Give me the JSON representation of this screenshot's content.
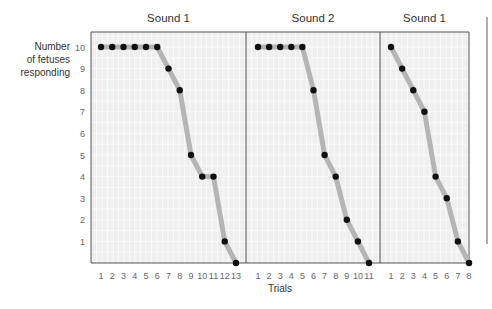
{
  "chart_data": {
    "type": "line",
    "ylabel": "Number of fetuses responding",
    "xlabel": "Trials",
    "ylim": [
      0,
      10
    ],
    "yticks": [
      1,
      2,
      3,
      4,
      5,
      6,
      7,
      8,
      9,
      10
    ],
    "grid": true,
    "legend": null,
    "panels": [
      {
        "title": "Sound 1",
        "x": [
          1,
          2,
          3,
          4,
          5,
          6,
          7,
          8,
          9,
          10,
          11,
          12,
          13
        ],
        "values": [
          10,
          10,
          10,
          10,
          10,
          10,
          9,
          8,
          5,
          4,
          4,
          1,
          0
        ]
      },
      {
        "title": "Sound 2",
        "x": [
          1,
          2,
          3,
          4,
          5,
          6,
          7,
          8,
          9,
          10,
          11
        ],
        "values": [
          10,
          10,
          10,
          10,
          10,
          8,
          5,
          4,
          2,
          1,
          0
        ]
      },
      {
        "title": "Sound 1",
        "x": [
          1,
          2,
          3,
          4,
          5,
          6,
          7,
          8
        ],
        "values": [
          10,
          9,
          8,
          7,
          4,
          3,
          1,
          0
        ]
      }
    ]
  },
  "labels": {
    "ylabel_line1": "Number",
    "ylabel_line2": "of fetuses",
    "ylabel_line3": "responding",
    "xlabel": "Trials"
  },
  "colors": {
    "panel_bg": "#efefef",
    "grid": "#ffffff",
    "frame": "#555555",
    "trend_line": "#b5b5b5",
    "point": "#111111"
  }
}
